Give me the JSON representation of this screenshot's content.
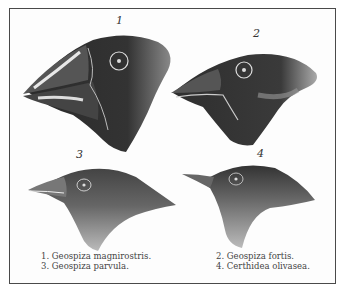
{
  "plate": {
    "figures": [
      {
        "number": "1",
        "name": "Geospiza magnirostris"
      },
      {
        "number": "2",
        "name": "Geospiza fortis"
      },
      {
        "number": "3",
        "name": "Geospiza parvula"
      },
      {
        "number": "4",
        "name": "Certhidea olivasea"
      }
    ],
    "captions": {
      "left": [
        "1. Geospiza magnirostris.",
        "3. Geospiza parvula."
      ],
      "right": [
        "2. Geospiza fortis.",
        "4. Certhidea olivasea."
      ]
    },
    "colors": {
      "ink": "#2a2a2a",
      "paper": "#fdfdfd",
      "border": "#4a4a4a"
    }
  }
}
